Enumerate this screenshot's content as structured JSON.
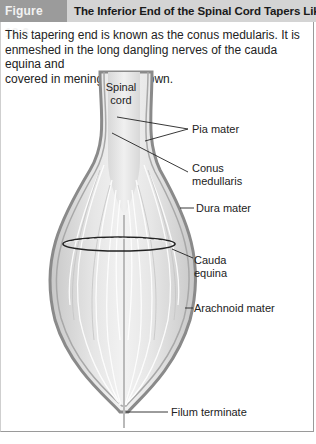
{
  "figure": {
    "number_label": "Figure 18.6",
    "title": "The Inferior End of the Spinal Cord Tapers Like a Cone",
    "caption_line1": "This tapering end is known as the conus medularis. It is",
    "caption_line2": "enmeshed in the long dangling nerves of the cauda equina and",
    "caption_line3": "covered in meninges as shown."
  },
  "labels": {
    "spinal_cord_line1": "Spinal",
    "spinal_cord_line2": "cord",
    "pia_mater": "Pia mater",
    "conus_line1": "Conus",
    "conus_line2": "medullaris",
    "dura_mater": "Dura mater",
    "cauda_line1": "Cauda",
    "cauda_line2": "equina",
    "arachnoid_mater": "Arachnoid mater",
    "filum_terminate": "Filum terminate"
  },
  "colors": {
    "tag_bg": "#9b9b9b",
    "header_bg": "#d4d4d4",
    "membrane": "#8a8a8a",
    "tissue": "#dcdcdc"
  }
}
